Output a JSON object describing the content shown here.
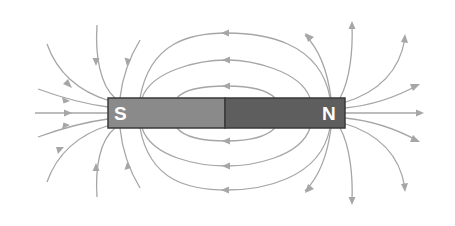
{
  "diagram": {
    "type": "bar-magnet-field-lines",
    "magnet": {
      "south_label": "S",
      "north_label": "N",
      "south_color": "#8a8a8a",
      "north_color": "#5e5e5e",
      "border_color": "#3a3a3a"
    },
    "field_line_color": "#a6a6a6",
    "field_direction": "Lines leave the N pole and re-enter at the S pole; the inner loops run right-to-left above and below the magnet",
    "inner_loops": [
      {
        "position": "above",
        "count": 2,
        "arrow": "left"
      },
      {
        "position": "below",
        "count": 2,
        "arrow": "left"
      }
    ],
    "south_pole_lines": {
      "count": 10,
      "arrow": "toward-magnet"
    },
    "north_pole_lines": {
      "count": 10,
      "arrow": "away-from-magnet"
    }
  }
}
